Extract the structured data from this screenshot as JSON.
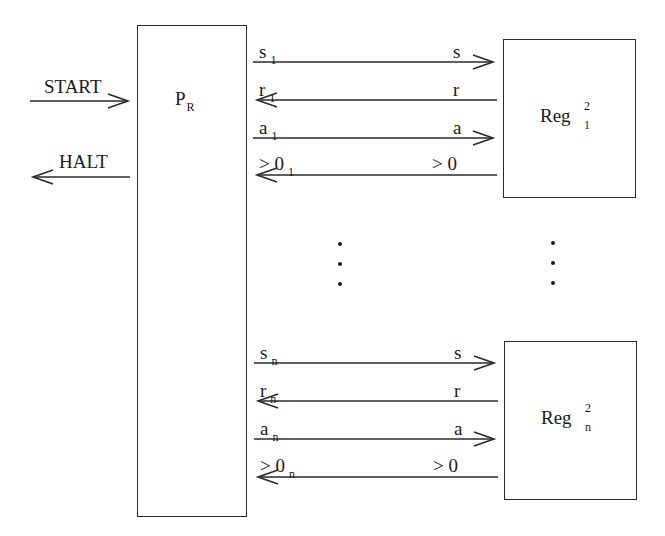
{
  "diagram": {
    "processor": {
      "label": "P",
      "subscript": "R"
    },
    "external_signals": {
      "start": {
        "label": "START",
        "direction": "in"
      },
      "halt": {
        "label": "HALT",
        "direction": "out"
      }
    },
    "registers": [
      {
        "label": "Reg",
        "superscript": "2",
        "subscript": "1",
        "channels": [
          {
            "left_label": "s",
            "left_sub": "1",
            "right_label": "s",
            "direction": "to-register"
          },
          {
            "left_label": "r",
            "left_sub": "1",
            "right_label": "r",
            "direction": "to-processor"
          },
          {
            "left_label": "a",
            "left_sub": "1",
            "right_label": "a",
            "direction": "to-register"
          },
          {
            "left_label": "> 0",
            "left_sub": "1",
            "right_label": "> 0",
            "direction": "to-processor"
          }
        ]
      },
      {
        "label": "Reg",
        "superscript": "2",
        "subscript": "n",
        "channels": [
          {
            "left_label": "s",
            "left_sub": "n",
            "right_label": "s",
            "direction": "to-register"
          },
          {
            "left_label": "r",
            "left_sub": "n",
            "right_label": "r",
            "direction": "to-processor"
          },
          {
            "left_label": "a",
            "left_sub": "n",
            "right_label": "a",
            "direction": "to-register"
          },
          {
            "left_label": "> 0",
            "left_sub": "n",
            "right_label": "> 0",
            "direction": "to-processor"
          }
        ]
      }
    ],
    "ellipsis": "vertical dots between register 1 and register n"
  },
  "colors": {
    "stroke": "#2a2a2a",
    "text": "#1a1a1a",
    "background": "#ffffff"
  }
}
